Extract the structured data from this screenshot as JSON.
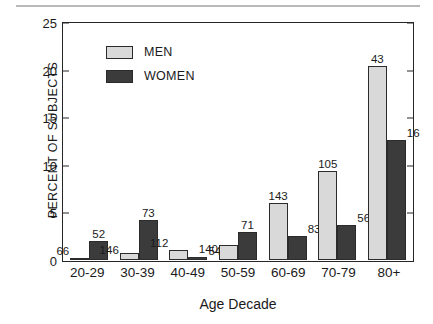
{
  "chart_data": {
    "type": "bar",
    "title": "",
    "xlabel": "Age Decade",
    "ylabel": "PERCENT OF SUBJECTS",
    "categories": [
      "20-29",
      "30-39",
      "40-49",
      "50-59",
      "60-69",
      "70-79",
      "80+"
    ],
    "ylim": [
      0,
      25
    ],
    "yticks": [
      0,
      5,
      10,
      15,
      20,
      25
    ],
    "grid": false,
    "legend_position": "upper-left-inside",
    "series": [
      {
        "name": "MEN",
        "color": "#d9d9d9",
        "values": [
          0.2,
          0.7,
          1.0,
          1.5,
          6.0,
          9.4,
          20.5
        ],
        "point_labels": [
          "66",
          "146",
          "112",
          "140",
          "143",
          "105",
          "43"
        ]
      },
      {
        "name": "WOMEN",
        "color": "#3b3b3b",
        "values": [
          2.0,
          4.2,
          0.3,
          2.9,
          2.5,
          3.7,
          12.6
        ],
        "point_labels": [
          "52",
          "73",
          "54",
          "71",
          "83",
          "56",
          "16"
        ]
      }
    ]
  },
  "axis": {
    "y_tick_labels": [
      "25",
      "20",
      "15",
      "10",
      "5",
      "0"
    ],
    "y_title": "PERCENT OF SUBJECTS",
    "x_title": "Age Decade"
  },
  "legend": {
    "items": [
      {
        "label": "MEN",
        "color": "#d9d9d9"
      },
      {
        "label": "WOMEN",
        "color": "#3b3b3b"
      }
    ]
  }
}
